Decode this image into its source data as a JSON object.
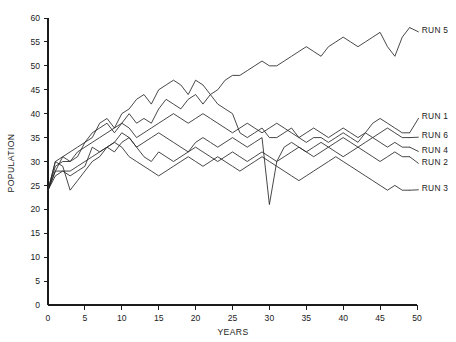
{
  "chart_data": {
    "type": "line",
    "title": "",
    "xlabel": "YEARS",
    "ylabel": "POPULATION",
    "xlim": [
      0,
      50
    ],
    "ylim": [
      0,
      60
    ],
    "xticks": [
      0,
      5,
      10,
      15,
      20,
      25,
      30,
      35,
      40,
      45,
      50
    ],
    "yticks": [
      0,
      5,
      10,
      15,
      20,
      25,
      30,
      35,
      40,
      45,
      50,
      55,
      60
    ],
    "grid": false,
    "legend_position": "right-inline-labels",
    "x": [
      0,
      1,
      2,
      3,
      4,
      5,
      6,
      7,
      8,
      9,
      10,
      11,
      12,
      13,
      14,
      15,
      16,
      17,
      18,
      19,
      20,
      21,
      22,
      23,
      24,
      25,
      26,
      27,
      28,
      29,
      30,
      31,
      32,
      33,
      34,
      35,
      36,
      37,
      38,
      39,
      40,
      41,
      42,
      43,
      44,
      45,
      46,
      47,
      48,
      49
    ],
    "series": [
      {
        "name": "RUN 1",
        "label": "RUN 1",
        "label_x": 50.5,
        "label_y": 39.5,
        "values": [
          24,
          29,
          30,
          30,
          31,
          34,
          36,
          37,
          38,
          36,
          38,
          40,
          38,
          39,
          38,
          41,
          43,
          42,
          41,
          43,
          44,
          42,
          44,
          42,
          41,
          40,
          36,
          35,
          36,
          37,
          35,
          35,
          36,
          37,
          35,
          34,
          35,
          35,
          34,
          35,
          36,
          35,
          34,
          36,
          38,
          39,
          38,
          37,
          36,
          36
        ]
      },
      {
        "name": "RUN 2",
        "label": "RUN 2",
        "label_x": 50.5,
        "label_y": 30.0,
        "values": [
          24,
          28,
          28,
          28,
          29,
          30,
          31,
          32,
          33,
          32,
          34,
          35,
          33,
          31,
          30,
          32,
          31,
          30,
          31,
          32,
          33,
          32,
          31,
          30,
          31,
          32,
          31,
          30,
          31,
          32,
          31,
          30,
          31,
          32,
          33,
          32,
          31,
          32,
          33,
          32,
          31,
          32,
          33,
          32,
          31,
          30,
          31,
          32,
          31,
          31
        ]
      },
      {
        "name": "RUN 3",
        "label": "RUN 3",
        "label_x": 50.5,
        "label_y": 24.5,
        "values": [
          24,
          27,
          28,
          27,
          28,
          29,
          33,
          32,
          33,
          34,
          33,
          31,
          30,
          29,
          28,
          27,
          28,
          29,
          30,
          31,
          30,
          29,
          30,
          31,
          30,
          29,
          28,
          29,
          30,
          31,
          30,
          29,
          28,
          27,
          26,
          27,
          28,
          29,
          30,
          31,
          30,
          29,
          28,
          27,
          26,
          25,
          24,
          25,
          24,
          24
        ]
      },
      {
        "name": "RUN 4",
        "label": "RUN 4",
        "label_x": 50.5,
        "label_y": 32.5,
        "values": [
          24,
          30,
          29,
          24,
          26,
          28,
          30,
          31,
          33,
          34,
          36,
          35,
          33,
          34,
          35,
          36,
          35,
          34,
          33,
          32,
          34,
          35,
          34,
          33,
          34,
          35,
          34,
          33,
          34,
          35,
          21,
          30,
          33,
          34,
          33,
          32,
          33,
          34,
          33,
          34,
          35,
          34,
          33,
          34,
          35,
          34,
          33,
          34,
          33,
          33
        ]
      },
      {
        "name": "RUN 5",
        "label": "RUN 5",
        "label_x": 50.5,
        "label_y": 57.5,
        "values": [
          24,
          30,
          31,
          32,
          33,
          34,
          35,
          38,
          39,
          37,
          40,
          41,
          43,
          44,
          42,
          45,
          46,
          47,
          46,
          44,
          47,
          46,
          44,
          45,
          47,
          48,
          48,
          49,
          50,
          51,
          50,
          50,
          51,
          52,
          53,
          54,
          53,
          52,
          54,
          55,
          56,
          55,
          54,
          55,
          56,
          57,
          54,
          52,
          56,
          58
        ]
      },
      {
        "name": "RUN 6",
        "label": "RUN 6",
        "label_x": 50.5,
        "label_y": 35.5,
        "values": [
          24,
          28,
          31,
          30,
          32,
          33,
          34,
          35,
          36,
          37,
          38,
          37,
          35,
          36,
          37,
          38,
          39,
          40,
          39,
          38,
          39,
          40,
          39,
          38,
          37,
          36,
          37,
          38,
          37,
          36,
          37,
          38,
          37,
          36,
          35,
          36,
          37,
          36,
          35,
          36,
          37,
          36,
          35,
          36,
          35,
          36,
          37,
          36,
          35,
          35
        ]
      }
    ]
  }
}
